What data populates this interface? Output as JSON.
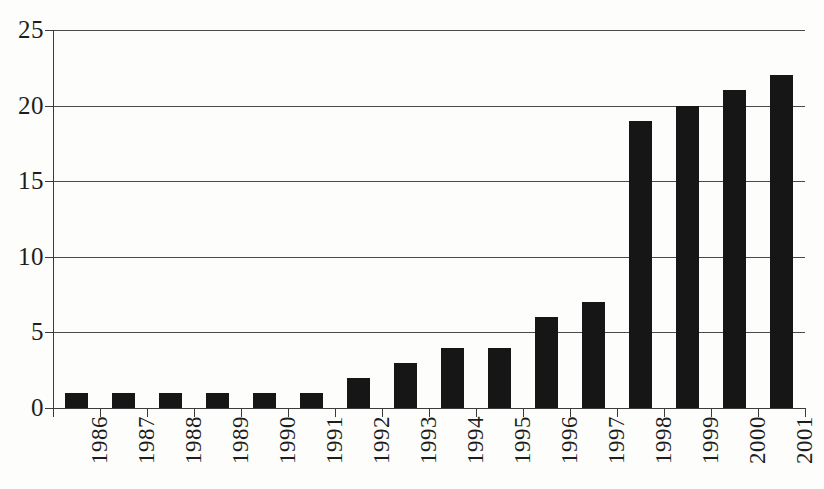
{
  "chart_data": {
    "type": "bar",
    "title": "",
    "subtitle": "",
    "xlabel": "",
    "ylabel": "",
    "categories": [
      "1986",
      "1987",
      "1988",
      "1989",
      "1990",
      "1991",
      "1992",
      "1993",
      "1994",
      "1995",
      "1996",
      "1997",
      "1998",
      "1999",
      "2000",
      "2001"
    ],
    "values": [
      1,
      1,
      1,
      1,
      1,
      1,
      2,
      3,
      4,
      4,
      6,
      7,
      19,
      20,
      21,
      22
    ],
    "ylim": [
      0,
      25
    ],
    "yticks": [
      0,
      5,
      10,
      15,
      20,
      25
    ],
    "ytick_labels": [
      "0",
      "5",
      "10",
      "15",
      "20",
      "25"
    ],
    "grid": "horizontal",
    "legend": "none",
    "bar_color": "#161616",
    "axis_color": "#3b3b3b",
    "background_color": "#fdfdfb",
    "xtick_label_rotation": 90
  }
}
